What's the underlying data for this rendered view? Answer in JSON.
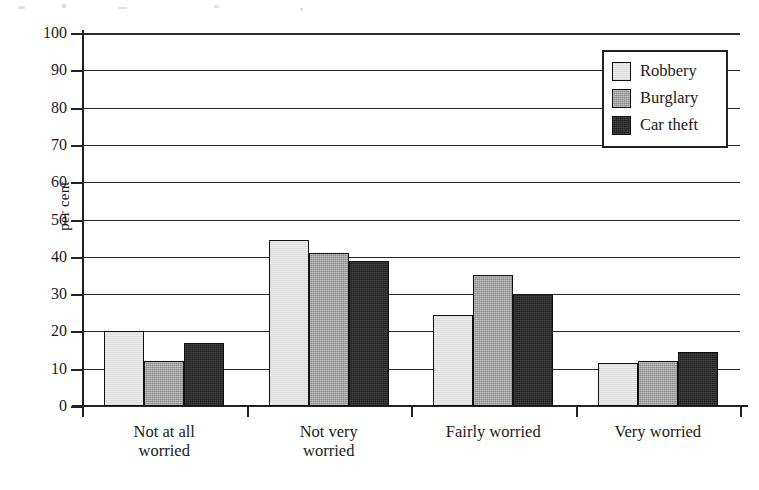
{
  "chart_data": {
    "type": "bar",
    "title": "",
    "subtitle": "",
    "xlabel": "",
    "ylabel": "per cent",
    "ylim": [
      0,
      100
    ],
    "yticks": [
      0,
      10,
      20,
      30,
      40,
      50,
      60,
      70,
      80,
      90,
      100
    ],
    "ytick_labels": [
      "0",
      "10",
      "20",
      "30",
      "40",
      "50",
      "60",
      "70",
      "80",
      "90",
      "100"
    ],
    "grid": "horizontal",
    "legend_position": "top-right",
    "categories": [
      "Not at all\nworried",
      "Not very\nworried",
      "Fairly worried",
      "Very worried"
    ],
    "series": [
      {
        "name": "Robbery",
        "color": "#ececec",
        "values": [
          20,
          44.5,
          24.5,
          11.5
        ]
      },
      {
        "name": "Burglary",
        "color": "#8a8a8a",
        "values": [
          12,
          41,
          35,
          12
        ]
      },
      {
        "name": "Car theft",
        "color": "#1e1e1e",
        "values": [
          17,
          39,
          30,
          14.5
        ]
      }
    ]
  },
  "legend": {
    "items": [
      {
        "label": "Robbery",
        "swatch": "robbery-swatch"
      },
      {
        "label": "Burglary",
        "swatch": "burglary-swatch"
      },
      {
        "label": "Car theft",
        "swatch": "car-theft-swatch"
      }
    ]
  }
}
